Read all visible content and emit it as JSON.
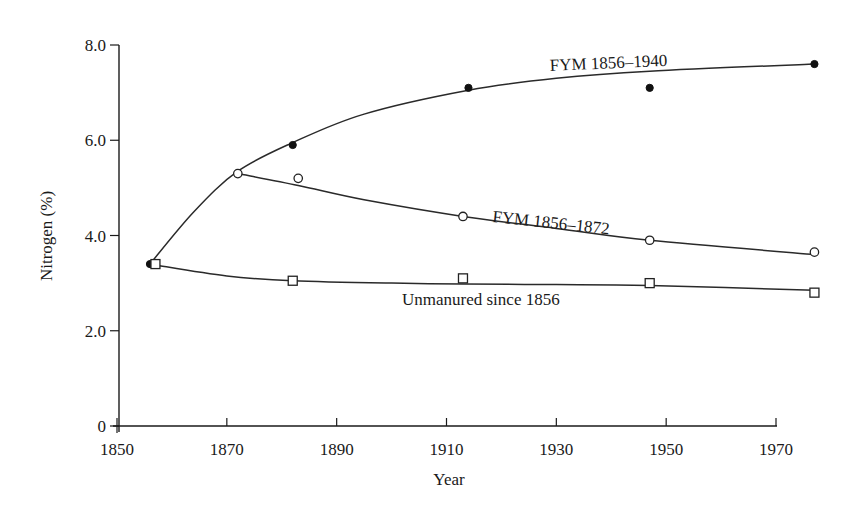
{
  "chart_data": {
    "type": "line",
    "title": "",
    "xlabel": "Year",
    "ylabel": "Nitrogen (%)",
    "xlim": [
      1850,
      1970
    ],
    "ylim": [
      0,
      8.0
    ],
    "x_ticks": [
      1850,
      1870,
      1890,
      1910,
      1930,
      1950,
      1970
    ],
    "x_tick_labels": [
      "1850",
      "1870",
      "1890",
      "1910",
      "1930",
      "1950",
      "1970"
    ],
    "y_ticks": [
      0,
      2.0,
      4.0,
      6.0,
      8.0
    ],
    "y_tick_labels": [
      "0",
      "2.0",
      "4.0",
      "6.0",
      "8.0"
    ],
    "grid": false,
    "legend": "none (series labelled inline on the plot)",
    "series": [
      {
        "name": "FYM 1856–1940",
        "marker": "filled-circle",
        "x": [
          1856,
          1882,
          1914,
          1947,
          1977
        ],
        "values": [
          3.4,
          5.9,
          7.1,
          7.1,
          7.6
        ],
        "curve": [
          [
            1856,
            3.4
          ],
          [
            1864,
            4.5
          ],
          [
            1872,
            5.35
          ],
          [
            1882,
            5.95
          ],
          [
            1895,
            6.55
          ],
          [
            1914,
            7.05
          ],
          [
            1930,
            7.3
          ],
          [
            1947,
            7.45
          ],
          [
            1977,
            7.6
          ]
        ],
        "label_pos": [
          1856,
          7.25
        ],
        "label_anchor": {
          "x": 550,
          "y": 71,
          "rotate": -2.5
        }
      },
      {
        "name": "FYM 1856–1872",
        "marker": "open-circle",
        "x": [
          1872,
          1883,
          1913,
          1947,
          1977
        ],
        "values": [
          5.3,
          5.2,
          4.4,
          3.9,
          3.65
        ],
        "curve": [
          [
            1872,
            5.3
          ],
          [
            1883,
            5.05
          ],
          [
            1895,
            4.75
          ],
          [
            1913,
            4.4
          ],
          [
            1930,
            4.15
          ],
          [
            1947,
            3.9
          ],
          [
            1977,
            3.6
          ]
        ],
        "label_anchor": {
          "x": 492,
          "y": 222,
          "rotate": 6
        }
      },
      {
        "name": "Unmanured since 1856",
        "marker": "square",
        "x": [
          1857,
          1882,
          1913,
          1947,
          1977
        ],
        "values": [
          3.4,
          3.05,
          3.1,
          3.0,
          2.8
        ],
        "curve": [
          [
            1857,
            3.38
          ],
          [
            1870,
            3.15
          ],
          [
            1882,
            3.05
          ],
          [
            1900,
            3.0
          ],
          [
            1913,
            2.98
          ],
          [
            1930,
            2.97
          ],
          [
            1947,
            2.95
          ],
          [
            1977,
            2.85
          ]
        ],
        "label_anchor": {
          "x": 402,
          "y": 305,
          "rotate": 0
        }
      }
    ]
  }
}
